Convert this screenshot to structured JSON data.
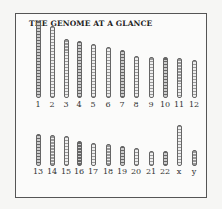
{
  "title": "THE GENOME AT A GLANCE",
  "row1": [
    {
      "label": "1",
      "x": 16,
      "top": 20,
      "h": 77
    },
    {
      "label": "2",
      "x": 30,
      "top": 25,
      "h": 72
    },
    {
      "label": "3",
      "x": 44,
      "top": 38,
      "h": 59
    },
    {
      "label": "4",
      "x": 57,
      "top": 40,
      "h": 57
    },
    {
      "label": "5",
      "x": 71,
      "top": 43,
      "h": 54
    },
    {
      "label": "6",
      "x": 86,
      "top": 46,
      "h": 51
    },
    {
      "label": "7",
      "x": 100,
      "top": 49,
      "h": 48
    },
    {
      "label": "8",
      "x": 114,
      "top": 55,
      "h": 42
    },
    {
      "label": "9",
      "x": 129,
      "top": 56,
      "h": 41
    },
    {
      "label": "10",
      "x": 143,
      "top": 56,
      "h": 41
    },
    {
      "label": "11",
      "x": 157,
      "top": 57,
      "h": 40
    },
    {
      "label": "12",
      "x": 172,
      "top": 59,
      "h": 38
    }
  ],
  "row2": [
    {
      "label": "13",
      "x": 16,
      "top": 133,
      "h": 32
    },
    {
      "label": "14",
      "x": 30,
      "top": 134,
      "h": 31
    },
    {
      "label": "15",
      "x": 44,
      "top": 135,
      "h": 30
    },
    {
      "label": "16",
      "x": 57,
      "top": 140,
      "h": 25
    },
    {
      "label": "17",
      "x": 71,
      "top": 142,
      "h": 23
    },
    {
      "label": "18",
      "x": 86,
      "top": 143,
      "h": 22
    },
    {
      "label": "19",
      "x": 100,
      "top": 145,
      "h": 20
    },
    {
      "label": "20",
      "x": 114,
      "top": 147,
      "h": 18
    },
    {
      "label": "21",
      "x": 129,
      "top": 150,
      "h": 15
    },
    {
      "label": "22",
      "x": 143,
      "top": 150,
      "h": 15
    },
    {
      "label": "x",
      "x": 157,
      "top": 124,
      "h": 41
    },
    {
      "label": "y",
      "x": 172,
      "top": 149,
      "h": 16
    }
  ]
}
